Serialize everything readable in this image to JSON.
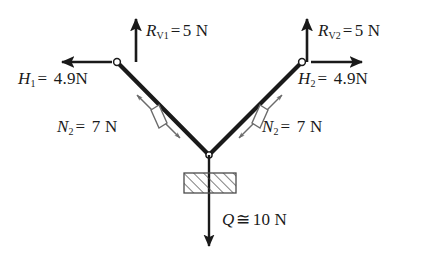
{
  "figure": {
    "background_color": "#ffffff",
    "line_color": "#1a1a1a"
  },
  "labels": {
    "reaction_vertical_left": {
      "symbol": "R",
      "subscript": "V1",
      "operator": "=",
      "value": "5",
      "unit": "N",
      "text": "R_V1 = 5 N"
    },
    "reaction_vertical_right": {
      "symbol": "R",
      "subscript": "V2",
      "operator": "=",
      "value": "5",
      "unit": "N",
      "text": "R_V2 = 5 N"
    },
    "horizontal_left": {
      "symbol": "H",
      "subscript": "1",
      "operator": "=",
      "value": "4.9",
      "unit": "N",
      "text": "H_1 = 4.9N"
    },
    "horizontal_right": {
      "symbol": "H",
      "subscript": "2",
      "operator": "=",
      "value": "4.9",
      "unit": "N",
      "text": "H_2 = 4.9N"
    },
    "normal_force_left": {
      "symbol": "N",
      "subscript": "2",
      "operator": "=",
      "value": "7",
      "unit": "N",
      "text": "N_2 = 7 N"
    },
    "normal_force_right": {
      "symbol": "N",
      "subscript": "2",
      "operator": "=",
      "value": "7",
      "unit": "N",
      "text": "N_2 = 7 N"
    },
    "load": {
      "symbol": "Q",
      "subscript": "",
      "operator": "≅",
      "value": "10",
      "unit": "N",
      "text": "Q ≅ 10 N"
    }
  },
  "geometry": {
    "left_pin": {
      "x": 117,
      "y": 62
    },
    "right_pin": {
      "x": 302,
      "y": 62
    },
    "apex": {
      "x": 209,
      "y": 155
    },
    "block": {
      "x": 184,
      "y": 173,
      "width": 52,
      "height": 20
    },
    "load_arrow_end": {
      "x": 209,
      "y": 246
    }
  },
  "icons": {
    "pin_joint_left": "pin-joint-icon",
    "pin_joint_right": "pin-joint-icon",
    "apex_joint": "pin-joint-icon",
    "hatched_block": "hatched-block-icon"
  }
}
